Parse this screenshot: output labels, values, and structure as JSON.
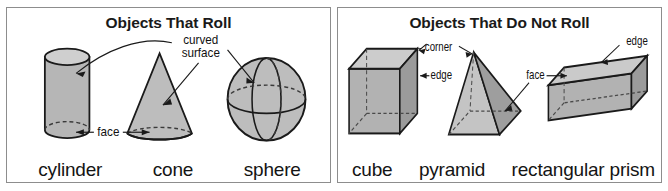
{
  "figure": {
    "type": "educational-diagram",
    "topic": "Objects That Roll and Objects That Do Not Roll",
    "background_color": "#ffffff",
    "panel_border_color": "#8d8d8d"
  },
  "panels": [
    {
      "id": "roll",
      "title": "Objects That Roll",
      "shapes": [
        {
          "name": "cylinder",
          "annotations": [
            "curved surface",
            "face"
          ]
        },
        {
          "name": "cone",
          "annotations": [
            "curved surface",
            "face"
          ]
        },
        {
          "name": "sphere",
          "annotations": [
            "curved surface"
          ]
        }
      ],
      "annotations": [
        {
          "label": "curved",
          "line2": "surface",
          "full": "curved surface",
          "points_to": [
            "cylinder",
            "cone",
            "sphere"
          ]
        },
        {
          "label": "face",
          "full": "face",
          "points_to": [
            "cylinder",
            "cone"
          ]
        }
      ]
    },
    {
      "id": "no-roll",
      "title": "Objects That Do Not Roll",
      "shapes": [
        {
          "name": "cube",
          "annotations": [
            "corner",
            "edge"
          ]
        },
        {
          "name": "pyramid",
          "annotations": [
            "corner",
            "face"
          ]
        },
        {
          "name": "rectangular prism",
          "annotations": [
            "edge",
            "face"
          ]
        }
      ],
      "annotations": [
        {
          "label": "corner",
          "full": "corner",
          "points_to": [
            "cube",
            "pyramid"
          ]
        },
        {
          "label": "edge",
          "full": "edge",
          "points_to": [
            "cube"
          ]
        },
        {
          "label": "face",
          "full": "face",
          "points_to": [
            "pyramid",
            "rectangular prism"
          ]
        },
        {
          "label": "edge",
          "full": "edge",
          "points_to": [
            "rectangular prism"
          ]
        }
      ]
    }
  ],
  "colors": {
    "outline": "#1a1a1a",
    "fill_light": "#c9c9c9",
    "fill_mid": "#b4b4b4",
    "fill_dark": "#9a9a9a",
    "fill_darker": "#8a8a8a",
    "text": "#141414"
  }
}
